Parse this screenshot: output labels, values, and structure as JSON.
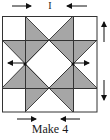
{
  "diagram": {
    "title_mark": "I",
    "caption": "Make 4",
    "colors": {
      "fill": "#a6a6a6",
      "line": "#333333",
      "background": "#ffffff"
    },
    "grid": {
      "rows": 4,
      "cols": 4,
      "outer": {
        "x": 2,
        "y": 16,
        "width": 95,
        "height": 96
      },
      "col_lines": [
        25,
        73
      ],
      "row_lines": [
        40,
        88
      ]
    },
    "pressing_arrows": [
      {
        "position": "top-left",
        "direction": "right"
      },
      {
        "position": "top-right",
        "direction": "left"
      },
      {
        "position": "middle-left",
        "direction": "left"
      },
      {
        "position": "middle-right",
        "direction": "right"
      },
      {
        "position": "right-upper",
        "direction": "up"
      },
      {
        "position": "right-lower",
        "direction": "down"
      },
      {
        "position": "bottom-left",
        "direction": "right"
      },
      {
        "position": "bottom-right",
        "direction": "left"
      }
    ]
  }
}
